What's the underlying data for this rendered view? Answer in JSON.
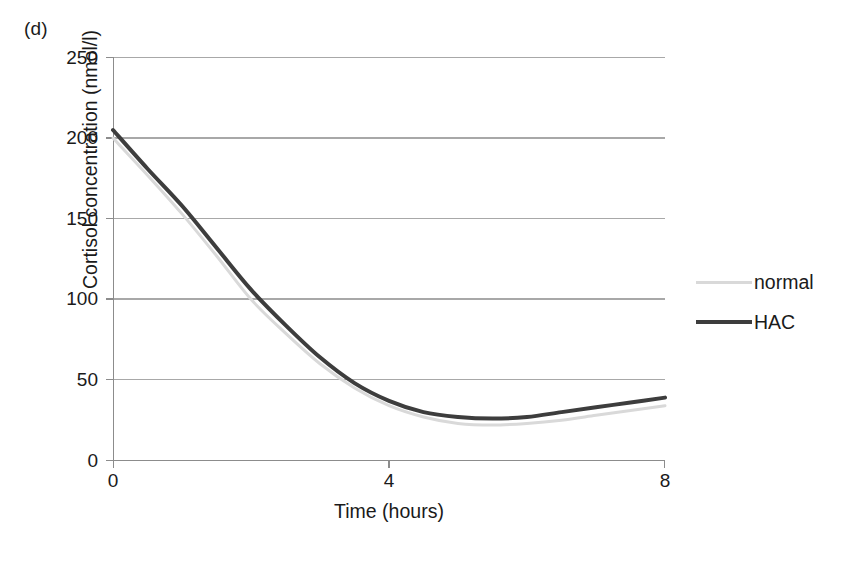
{
  "panel": {
    "label": "(d)"
  },
  "chart_data": {
    "type": "line",
    "title": "",
    "xlabel": "Time (hours)",
    "ylabel": "Cortisol concentration (nmol/l)",
    "xlim": [
      0,
      8
    ],
    "ylim": [
      0,
      250
    ],
    "xticks": [
      0,
      4,
      8
    ],
    "xtick_labels": [
      "0",
      "4",
      "8"
    ],
    "yticks": [
      0,
      50,
      100,
      150,
      200,
      250
    ],
    "ytick_labels": [
      "0",
      "50",
      "100",
      "150",
      "200",
      "250"
    ],
    "grid": "horizontal",
    "legend_position": "right",
    "x": [
      0,
      0.5,
      1,
      1.5,
      2,
      2.5,
      3,
      3.5,
      4,
      4.5,
      5,
      5.5,
      6,
      6.5,
      7,
      7.5,
      8
    ],
    "series": [
      {
        "name": "normal",
        "color": "#d9d9d9",
        "line_width": 3,
        "values": [
          200,
          177,
          153,
          127,
          100,
          79,
          60,
          45,
          34,
          27,
          23,
          22,
          23,
          25,
          28,
          31,
          34
        ]
      },
      {
        "name": "HAC",
        "color": "#3d3d3d",
        "line_width": 4,
        "values": [
          205,
          181,
          158,
          132,
          106,
          84,
          64,
          48,
          37,
          30,
          27,
          26,
          27,
          30,
          33,
          36,
          39
        ]
      }
    ]
  },
  "colors": {
    "axis": "#8c8c8c",
    "grid": "#a8a8a8",
    "text": "#1a1a1a",
    "normal_series": "#d9d9d9",
    "hac_series": "#3d3d3d",
    "background": "#ffffff"
  },
  "legend": {
    "items": [
      {
        "label": "normal"
      },
      {
        "label": "HAC"
      }
    ]
  }
}
